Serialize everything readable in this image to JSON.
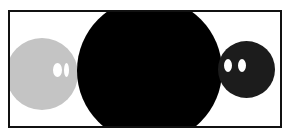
{
  "scene": {
    "frame": {
      "border_color": "#111111",
      "background": "#ffffff"
    },
    "shapes": [
      {
        "name": "gray-face",
        "color": "#c4c4c4",
        "eyes": 2,
        "eye_color": "#ffffff"
      },
      {
        "name": "large-black-circle",
        "color": "#000000"
      },
      {
        "name": "dark-face",
        "color": "#1c1c1c",
        "eyes": 2,
        "eye_color": "#ffffff"
      }
    ]
  }
}
